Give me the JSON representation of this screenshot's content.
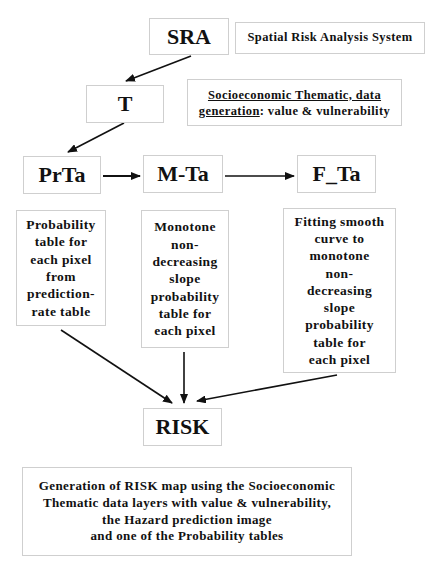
{
  "nodes": {
    "sra": "SRA",
    "t": "T",
    "prta": "PrTa",
    "mta": "M-Ta",
    "fta": "F_Ta",
    "risk": "RISK"
  },
  "labels": {
    "sra_desc": "Spatial Risk Analysis System",
    "t_desc": {
      "underlined_1": "Socioeconomic Thematic, data",
      "underlined_2": "generation",
      "rest_2": ": value & vulnerability"
    },
    "prta_desc": [
      "Probability",
      "table for",
      "each pixel",
      "from",
      "prediction-",
      "rate table"
    ],
    "mta_desc": [
      "Monotone",
      "non-",
      "decreasing",
      "slope",
      "probability",
      "table for",
      "each pixel"
    ],
    "fta_desc": [
      "Fitting smooth",
      "curve to",
      "monotone",
      "non-",
      "decreasing",
      "slope",
      "probability",
      "table for",
      "each pixel"
    ],
    "risk_desc": [
      "Generation of RISK map using the Socioeconomic",
      "Thematic data layers with value & vulnerability,",
      "the Hazard prediction image",
      "and one of the Probability tables"
    ]
  },
  "edges": [
    {
      "from": "SRA",
      "to": "T"
    },
    {
      "from": "T",
      "to": "PrTa"
    },
    {
      "from": "PrTa",
      "to": "M-Ta"
    },
    {
      "from": "M-Ta",
      "to": "F_Ta"
    },
    {
      "from": "PrTa",
      "to": "RISK"
    },
    {
      "from": "M-Ta",
      "to": "RISK"
    },
    {
      "from": "F_Ta",
      "to": "RISK"
    }
  ],
  "colors": {
    "border": "#cfcfcf",
    "arrow": "#111111",
    "text": "#111111"
  }
}
